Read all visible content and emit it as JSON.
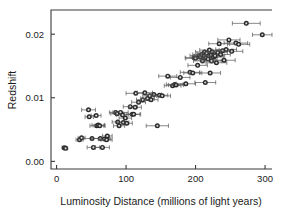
{
  "chart_data": {
    "type": "scatter",
    "title": "",
    "xlabel": "Luminosity Distance (millions of light years)",
    "ylabel": "Redshift",
    "xlim": [
      -8,
      310
    ],
    "ylim": [
      -0.0012,
      0.0238
    ],
    "xticks": [
      0,
      100,
      200,
      300
    ],
    "xticklabels": [
      "0",
      "100",
      "200",
      "300"
    ],
    "yticks": [
      0.0,
      0.01,
      0.02
    ],
    "yticklabels": [
      "0.00",
      "0.01",
      "0.02"
    ],
    "grid": false,
    "legend": null,
    "error_bars": "horizontal",
    "marker": "circle-with-light-center",
    "points": [
      {
        "x": 11,
        "y": 0.00215,
        "xerr": 3
      },
      {
        "x": 13,
        "y": 0.00205,
        "xerr": 3
      },
      {
        "x": 33,
        "y": 0.0034,
        "xerr": 5
      },
      {
        "x": 36,
        "y": 0.0037,
        "xerr": 5
      },
      {
        "x": 46,
        "y": 0.0081,
        "xerr": 10
      },
      {
        "x": 47,
        "y": 0.007,
        "xerr": 6
      },
      {
        "x": 51,
        "y": 0.0036,
        "xerr": 12
      },
      {
        "x": 53,
        "y": 0.0022,
        "xerr": 9
      },
      {
        "x": 57,
        "y": 0.0072,
        "xerr": 7
      },
      {
        "x": 58,
        "y": 0.0056,
        "xerr": 10
      },
      {
        "x": 60,
        "y": 0.0057,
        "xerr": 9
      },
      {
        "x": 62,
        "y": 0.0056,
        "xerr": 8
      },
      {
        "x": 63,
        "y": 0.0036,
        "xerr": 13
      },
      {
        "x": 66,
        "y": 0.0022,
        "xerr": 10
      },
      {
        "x": 69,
        "y": 0.0035,
        "xerr": 9
      },
      {
        "x": 72,
        "y": 0.0034,
        "xerr": 8
      },
      {
        "x": 73,
        "y": 0.004,
        "xerr": 7
      },
      {
        "x": 85,
        "y": 0.0077,
        "xerr": 9
      },
      {
        "x": 87,
        "y": 0.0075,
        "xerr": 9
      },
      {
        "x": 88,
        "y": 0.0062,
        "xerr": 8
      },
      {
        "x": 90,
        "y": 0.0056,
        "xerr": 8
      },
      {
        "x": 92,
        "y": 0.0077,
        "xerr": 11
      },
      {
        "x": 95,
        "y": 0.0073,
        "xerr": 9
      },
      {
        "x": 96,
        "y": 0.0061,
        "xerr": 8
      },
      {
        "x": 99,
        "y": 0.0068,
        "xerr": 9
      },
      {
        "x": 101,
        "y": 0.006,
        "xerr": 8
      },
      {
        "x": 106,
        "y": 0.0086,
        "xerr": 10
      },
      {
        "x": 109,
        "y": 0.0074,
        "xerr": 11
      },
      {
        "x": 111,
        "y": 0.0074,
        "xerr": 10
      },
      {
        "x": 113,
        "y": 0.0085,
        "xerr": 9
      },
      {
        "x": 114,
        "y": 0.0107,
        "xerr": 14
      },
      {
        "x": 118,
        "y": 0.0093,
        "xerr": 10
      },
      {
        "x": 124,
        "y": 0.0097,
        "xerr": 9
      },
      {
        "x": 127,
        "y": 0.0108,
        "xerr": 11
      },
      {
        "x": 131,
        "y": 0.0099,
        "xerr": 10
      },
      {
        "x": 134,
        "y": 0.0103,
        "xerr": 10
      },
      {
        "x": 136,
        "y": 0.0097,
        "xerr": 10
      },
      {
        "x": 140,
        "y": 0.0105,
        "xerr": 11
      },
      {
        "x": 145,
        "y": 0.0056,
        "xerr": 16
      },
      {
        "x": 148,
        "y": 0.0104,
        "xerr": 12
      },
      {
        "x": 152,
        "y": 0.0103,
        "xerr": 12
      },
      {
        "x": 160,
        "y": 0.0134,
        "xerr": 13
      },
      {
        "x": 167,
        "y": 0.0119,
        "xerr": 12
      },
      {
        "x": 170,
        "y": 0.0121,
        "xerr": 12
      },
      {
        "x": 172,
        "y": 0.012,
        "xerr": 11
      },
      {
        "x": 178,
        "y": 0.0132,
        "xerr": 14
      },
      {
        "x": 186,
        "y": 0.0122,
        "xerr": 14
      },
      {
        "x": 192,
        "y": 0.014,
        "xerr": 14
      },
      {
        "x": 196,
        "y": 0.0139,
        "xerr": 13
      },
      {
        "x": 198,
        "y": 0.0163,
        "xerr": 13
      },
      {
        "x": 200,
        "y": 0.0162,
        "xerr": 14
      },
      {
        "x": 203,
        "y": 0.0151,
        "xerr": 14
      },
      {
        "x": 205,
        "y": 0.0166,
        "xerr": 13
      },
      {
        "x": 207,
        "y": 0.0164,
        "xerr": 12
      },
      {
        "x": 209,
        "y": 0.0168,
        "xerr": 13
      },
      {
        "x": 210,
        "y": 0.0158,
        "xerr": 13
      },
      {
        "x": 212,
        "y": 0.0166,
        "xerr": 14
      },
      {
        "x": 213,
        "y": 0.0172,
        "xerr": 13
      },
      {
        "x": 214,
        "y": 0.0124,
        "xerr": 15
      },
      {
        "x": 215,
        "y": 0.0163,
        "xerr": 14
      },
      {
        "x": 216,
        "y": 0.017,
        "xerr": 14
      },
      {
        "x": 218,
        "y": 0.0161,
        "xerr": 13
      },
      {
        "x": 219,
        "y": 0.0166,
        "xerr": 13
      },
      {
        "x": 220,
        "y": 0.0175,
        "xerr": 14
      },
      {
        "x": 221,
        "y": 0.0139,
        "xerr": 15
      },
      {
        "x": 222,
        "y": 0.0167,
        "xerr": 14
      },
      {
        "x": 223,
        "y": 0.0158,
        "xerr": 14
      },
      {
        "x": 224,
        "y": 0.0172,
        "xerr": 13
      },
      {
        "x": 226,
        "y": 0.0164,
        "xerr": 14
      },
      {
        "x": 228,
        "y": 0.0166,
        "xerr": 14
      },
      {
        "x": 230,
        "y": 0.0155,
        "xerr": 15
      },
      {
        "x": 232,
        "y": 0.0171,
        "xerr": 14
      },
      {
        "x": 234,
        "y": 0.0185,
        "xerr": 15
      },
      {
        "x": 236,
        "y": 0.0168,
        "xerr": 14
      },
      {
        "x": 239,
        "y": 0.0174,
        "xerr": 15
      },
      {
        "x": 241,
        "y": 0.0159,
        "xerr": 16
      },
      {
        "x": 244,
        "y": 0.0176,
        "xerr": 15
      },
      {
        "x": 248,
        "y": 0.0191,
        "xerr": 16
      },
      {
        "x": 252,
        "y": 0.0173,
        "xerr": 16
      },
      {
        "x": 258,
        "y": 0.0186,
        "xerr": 17
      },
      {
        "x": 262,
        "y": 0.0184,
        "xerr": 16
      },
      {
        "x": 273,
        "y": 0.0217,
        "xerr": 20
      },
      {
        "x": 296,
        "y": 0.0199,
        "xerr": 14
      }
    ]
  },
  "axes": {
    "xlabel": "Luminosity Distance (millions of light years)",
    "ylabel": "Redshift"
  }
}
